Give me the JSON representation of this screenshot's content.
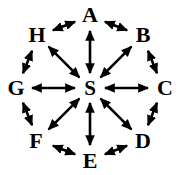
{
  "diagram": {
    "type": "graph",
    "background_color": "#ffffff",
    "stroke_color": "#000000",
    "center": {
      "id": "S",
      "label": "S",
      "x": 90,
      "y": 88
    },
    "nodes": [
      {
        "id": "A",
        "label": "A",
        "x": 90,
        "y": 16,
        "angle_deg": 90
      },
      {
        "id": "B",
        "label": "B",
        "x": 142,
        "y": 36,
        "angle_deg": 45
      },
      {
        "id": "C",
        "label": "C",
        "x": 163,
        "y": 88,
        "angle_deg": 0
      },
      {
        "id": "D",
        "label": "D",
        "x": 142,
        "y": 140,
        "angle_deg": -45
      },
      {
        "id": "E",
        "label": "E",
        "x": 90,
        "y": 160,
        "angle_deg": -90
      },
      {
        "id": "F",
        "label": "F",
        "x": 38,
        "y": 140,
        "angle_deg": -135
      },
      {
        "id": "G",
        "label": "G",
        "x": 17,
        "y": 88,
        "angle_deg": 180
      },
      {
        "id": "H",
        "label": "H",
        "x": 38,
        "y": 36,
        "angle_deg": 135
      }
    ],
    "spoke_edges": [
      {
        "from": "S",
        "to": "A",
        "arrow": "bidirectional"
      },
      {
        "from": "S",
        "to": "B",
        "arrow": "bidirectional"
      },
      {
        "from": "S",
        "to": "C",
        "arrow": "bidirectional"
      },
      {
        "from": "S",
        "to": "D",
        "arrow": "bidirectional"
      },
      {
        "from": "S",
        "to": "E",
        "arrow": "bidirectional"
      },
      {
        "from": "S",
        "to": "F",
        "arrow": "bidirectional"
      },
      {
        "from": "S",
        "to": "G",
        "arrow": "bidirectional"
      },
      {
        "from": "S",
        "to": "H",
        "arrow": "bidirectional"
      }
    ],
    "rim_edges": [
      {
        "from": "A",
        "to": "B",
        "arrow": "bidirectional"
      },
      {
        "from": "B",
        "to": "C",
        "arrow": "bidirectional"
      },
      {
        "from": "C",
        "to": "D",
        "arrow": "bidirectional"
      },
      {
        "from": "D",
        "to": "E",
        "arrow": "bidirectional"
      },
      {
        "from": "E",
        "to": "F",
        "arrow": "bidirectional"
      },
      {
        "from": "F",
        "to": "G",
        "arrow": "bidirectional"
      },
      {
        "from": "G",
        "to": "H",
        "arrow": "bidirectional"
      },
      {
        "from": "H",
        "to": "A",
        "arrow": "bidirectional"
      }
    ],
    "node_count": 9,
    "edge_count": 16
  }
}
